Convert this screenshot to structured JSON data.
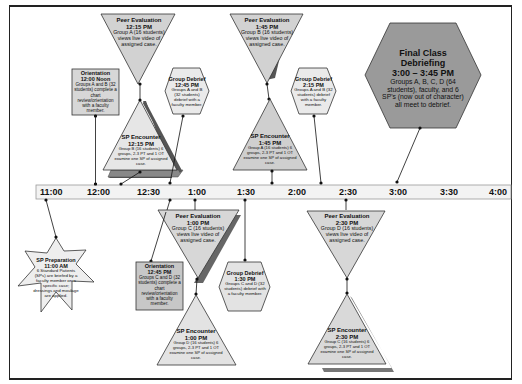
{
  "colors": {
    "shape_fill_light": "#d7d7d7",
    "shape_fill_mid": "#bfbfbf",
    "shape_fill_dark": "#9a9a9a",
    "shadow": "#666666",
    "line": "#222222",
    "timeline_fill": "#f3f3f3"
  },
  "timeline": {
    "ticks": [
      "11:00",
      "12:00",
      "12:30",
      "1:00",
      "1:30",
      "2:00",
      "2:30",
      "3:00",
      "3:30",
      "4:00"
    ]
  },
  "events": {
    "peer_eval_1215": {
      "shape": "inverted-triangle",
      "title": "Peer Evaluation",
      "time": "12:15 PM",
      "body": "Group A (16 students) views live video of assigned case."
    },
    "orientation_1200": {
      "shape": "rectangle",
      "title": "Orientation",
      "time": "12:00 Noon",
      "body": "Groups A and B (32 students) complete a chart review/orientation with a faculty member."
    },
    "sp_encounter_1215": {
      "shape": "triangle",
      "title": "SP Encounter",
      "time": "12:15 PM",
      "body": "Group B (16 students) 6 groups, 2-3 PT and 1 OT examine one SP of assigned case."
    },
    "group_debrief_1245": {
      "shape": "hexagon",
      "title": "Group Debrief",
      "time": "12:45 PM",
      "body": "Groups A and B (32 students) debrief with a faculty member."
    },
    "peer_eval_145": {
      "shape": "inverted-triangle",
      "title": "Peer Evaluation",
      "time": "1:45 PM",
      "body": "Group B (16 students) views live video of assigned case."
    },
    "sp_encounter_145": {
      "shape": "triangle",
      "title": "SP Encounter",
      "time": "1:45 PM",
      "body": "Group A (16 students) 6 groups, 2-3 PT and 1 OT examine one SP of assigned case."
    },
    "group_debrief_215": {
      "shape": "hexagon",
      "title": "Group Debrief",
      "time": "2:15 PM",
      "body": "Groups A and B (32 students) debrief with a faculty member."
    },
    "final_debrief": {
      "shape": "hexagon",
      "title": "Final Class Debriefing",
      "time": "3:00 – 3:45 PM",
      "body": "Groups A, B, C, D (64 students), faculty, and 6 SP's (now out of character) all meet to debrief."
    },
    "sp_preparation": {
      "shape": "star",
      "title": "SP Preparation",
      "time": "11:00 AM",
      "body": "6 Standard Patients (SPs) are briefed by a faculty member on a specific case; dressings and moulage are applied."
    },
    "orientation_1245": {
      "shape": "rectangle",
      "title": "Orientation",
      "time": "12:45 PM",
      "body": "Groups C and D (32 students) complete a chart review/orientation with a faculty member."
    },
    "peer_eval_100": {
      "shape": "inverted-triangle",
      "title": "Peer Evaluation",
      "time": "1:00 PM",
      "body": "Group C (16 students) views live video of assigned case."
    },
    "sp_encounter_100": {
      "shape": "triangle",
      "title": "SP Encounter",
      "time": "1:00 PM",
      "body": "Group D (16 students) 6 groups, 2-3 PT and 1 OT examine one SP of assigned case."
    },
    "group_debrief_130": {
      "shape": "hexagon",
      "title": "Group Debrief",
      "time": "1:30 PM",
      "body": "Groups C and D (32 students) debrief with a faculty member."
    },
    "peer_eval_230": {
      "shape": "inverted-triangle",
      "title": "Peer Evaluation",
      "time": "2:30 PM",
      "body": "Group D (16 students) views live video of assigned case."
    },
    "sp_encounter_230": {
      "shape": "triangle",
      "title": "SP Encounter",
      "time": "2:30 PM",
      "body": "Group C (16 students) 6 groups, 2-3 PT and 1 OT examine one SP of assigned case."
    }
  }
}
